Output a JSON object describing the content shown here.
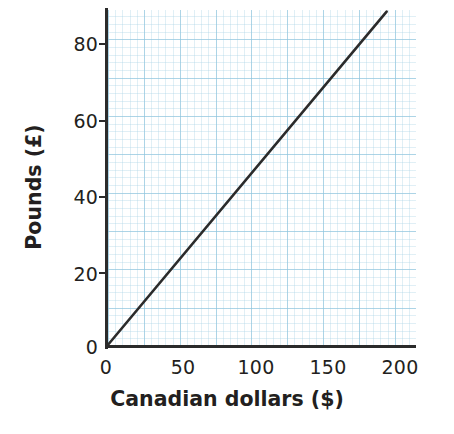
{
  "chart_data": {
    "type": "line",
    "title": "",
    "subtitle": "",
    "xlabel": "Canadian dollars ($)",
    "ylabel": "Pounds (£)",
    "xlim": [
      0,
      215
    ],
    "ylim": [
      0,
      88
    ],
    "x_ticks": [
      0,
      50,
      100,
      150,
      200
    ],
    "x_tick_labels": [
      "0",
      "50",
      "100",
      "150",
      "200"
    ],
    "y_ticks": [
      0,
      20,
      40,
      60,
      80
    ],
    "y_tick_labels": [
      "0",
      "20",
      "40",
      "60",
      "80"
    ],
    "x_minor_step": 5,
    "x_major_step": 25,
    "y_minor_step": 2,
    "y_major_step": 10,
    "grid": true,
    "grid_major_color": "#78b9d7",
    "grid_minor_color": "#96c8e1",
    "legend": false,
    "legend_position": "none",
    "annotations": [],
    "series": [
      {
        "name": "Canadian dollars to Pounds conversion",
        "color": "#2b2b2b",
        "linewidth": 2.6,
        "x": [
          0,
          25,
          50,
          75,
          100,
          125,
          150,
          175,
          195
        ],
        "values": [
          0,
          11.2,
          22.4,
          33.5,
          44.7,
          55.9,
          67.1,
          78.2,
          87.2
        ],
        "slope": 0.447,
        "intercept": 0
      }
    ]
  },
  "axes": {
    "y_title": "Pounds (£)",
    "x_title": "Canadian dollars ($)",
    "y_tick_labels": [
      "80",
      "60",
      "40",
      "20",
      "0"
    ],
    "x_tick_labels": [
      "0",
      "50",
      "100",
      "150",
      "200"
    ]
  },
  "colors": {
    "axis": "#2b2b2b",
    "series": "#2b2b2b",
    "grid_major": "#78b9d7",
    "grid_minor": "#96c8e1",
    "background": "#ffffff",
    "text": "#231f20"
  }
}
